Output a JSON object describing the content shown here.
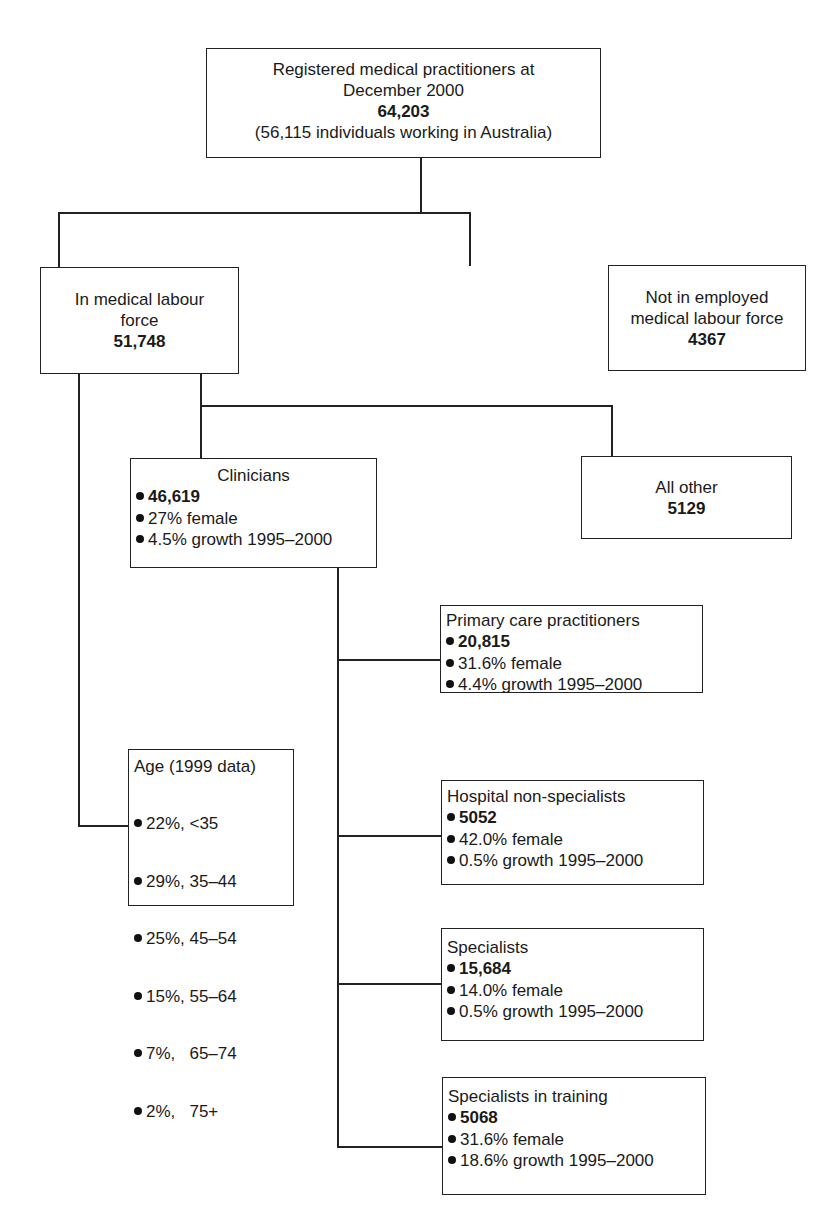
{
  "root": {
    "line1": "Registered medical practitioners at",
    "line2": "December 2000",
    "total": "64,203",
    "note": "(56,115 individuals working in Australia)"
  },
  "labour_force": {
    "line1": "In medical labour",
    "line2": "force",
    "total": "51,748"
  },
  "not_employed": {
    "line1": "Not in employed",
    "line2": "medical labour force",
    "total": "4367"
  },
  "clinicians": {
    "title": "Clinicians",
    "items": [
      "46,619",
      "27% female",
      "4.5% growth 1995–2000"
    ]
  },
  "all_other": {
    "title": "All other",
    "total": "5129"
  },
  "primary_care": {
    "title": "Primary care practitioners",
    "items": [
      "20,815",
      "31.6% female",
      "4.4% growth 1995–2000"
    ]
  },
  "hospital_non_specialists": {
    "title": "Hospital non-specialists",
    "items": [
      "5052",
      "42.0% female",
      "0.5% growth 1995–2000"
    ]
  },
  "specialists": {
    "title": "Specialists",
    "items": [
      "15,684",
      "14.0% female",
      "0.5% growth 1995–2000"
    ]
  },
  "specialists_training": {
    "title": "Specialists in training",
    "items": [
      "5068",
      "31.6% female",
      "18.6% growth 1995–2000"
    ]
  },
  "age": {
    "title": "Age (1999 data)",
    "items": [
      "22%, <35",
      "29%, 35–44",
      "25%, 45–54",
      "15%, 55–64",
      "7%,   65–74",
      "2%,   75+"
    ]
  }
}
